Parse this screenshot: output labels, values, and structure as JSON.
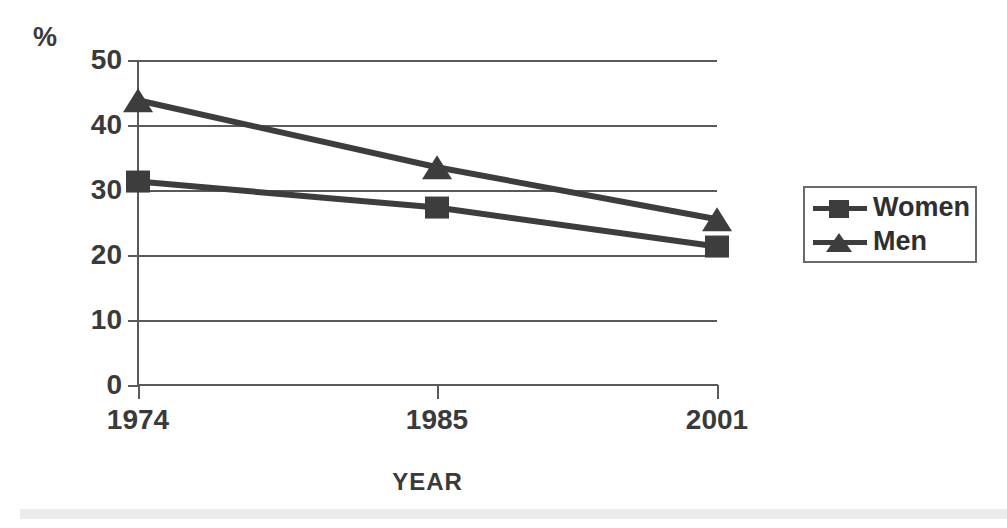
{
  "chart_data": {
    "type": "line",
    "title": "",
    "subtitle": "",
    "xlabel": "YEAR",
    "ylabel": "%",
    "categories": [
      "1974",
      "1985",
      "2001"
    ],
    "x": [
      1974,
      1985,
      2001
    ],
    "series": [
      {
        "name": "Women",
        "marker": "square",
        "values": [
          31.3,
          27.3,
          21.3
        ]
      },
      {
        "name": "Men",
        "marker": "triangle",
        "values": [
          43.8,
          33.5,
          25.5
        ]
      }
    ],
    "ylim": [
      0,
      50
    ],
    "ytick_labels": [
      "50",
      "40",
      "30",
      "20",
      "10",
      "0"
    ],
    "ytick_values": [
      50,
      40,
      30,
      20,
      10,
      0
    ],
    "grid": true,
    "grid_axis": "y",
    "legend_position": "right",
    "colors": {
      "series_women": "#3d3d3d",
      "series_men": "#3d3d3d",
      "axis": "#5a5a5a",
      "grid": "#5a5a5a",
      "text": "#3a3a3a",
      "background": "#ffffff",
      "bottom_band": "#ececed"
    }
  },
  "axes": {
    "y_title": "%",
    "x_title": "YEAR"
  },
  "yticks": [
    {
      "label": "50",
      "value": 50
    },
    {
      "label": "40",
      "value": 40
    },
    {
      "label": "30",
      "value": 30
    },
    {
      "label": "20",
      "value": 20
    },
    {
      "label": "10",
      "value": 10
    },
    {
      "label": "0",
      "value": 0
    }
  ],
  "xticks": [
    {
      "label": "1974"
    },
    {
      "label": "1985"
    },
    {
      "label": "2001"
    }
  ],
  "legend": {
    "items": [
      {
        "label": "Women",
        "marker": "square"
      },
      {
        "label": "Men",
        "marker": "triangle"
      }
    ]
  }
}
